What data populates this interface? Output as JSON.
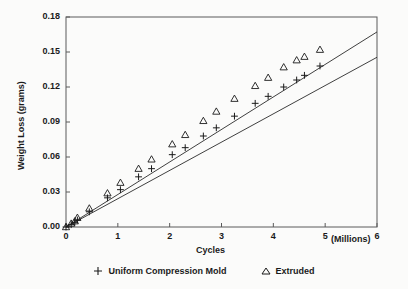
{
  "chart_data": {
    "type": "scatter",
    "title": "",
    "xlabel": "Cycles",
    "xunit": "(Millions)",
    "ylabel": "Weight Loss (grams)",
    "xlim": [
      0,
      6
    ],
    "ylim": [
      0,
      0.18
    ],
    "xticks": [
      "0",
      "1",
      "2",
      "3",
      "4",
      "5",
      "6"
    ],
    "xtick_values": [
      0,
      1,
      2,
      3,
      4,
      5,
      6
    ],
    "yticks": [
      "0.00",
      "0.03",
      "0.06",
      "0.09",
      "0.12",
      "0.15",
      "0.18"
    ],
    "ytick_values": [
      0,
      0.03,
      0.06,
      0.09,
      0.12,
      0.15,
      0.18
    ],
    "grid": false,
    "frame": "box",
    "legend_position": "below",
    "series": [
      {
        "name": "Uniform Compression Mold",
        "marker": "plus",
        "color": "#1a1a1a",
        "points": [
          [
            0.0,
            0.0
          ],
          [
            0.1,
            0.002
          ],
          [
            0.17,
            0.004
          ],
          [
            0.22,
            0.006
          ],
          [
            0.45,
            0.013
          ],
          [
            0.8,
            0.025
          ],
          [
            1.05,
            0.032
          ],
          [
            1.4,
            0.043
          ],
          [
            1.65,
            0.05
          ],
          [
            2.05,
            0.062
          ],
          [
            2.3,
            0.068
          ],
          [
            2.65,
            0.078
          ],
          [
            2.9,
            0.085
          ],
          [
            3.25,
            0.095
          ],
          [
            3.65,
            0.106
          ],
          [
            3.9,
            0.112
          ],
          [
            4.2,
            0.12
          ],
          [
            4.45,
            0.126
          ],
          [
            4.6,
            0.13
          ],
          [
            4.9,
            0.138
          ]
        ],
        "fit_line": {
          "x": [
            0,
            6
          ],
          "y": [
            0.0,
            0.1455
          ]
        }
      },
      {
        "name": "Extruded",
        "marker": "triangle",
        "color": "#1a1a1a",
        "points": [
          [
            0.0,
            0.0
          ],
          [
            0.1,
            0.003
          ],
          [
            0.17,
            0.005
          ],
          [
            0.22,
            0.008
          ],
          [
            0.45,
            0.016
          ],
          [
            0.8,
            0.029
          ],
          [
            1.05,
            0.038
          ],
          [
            1.4,
            0.05
          ],
          [
            1.65,
            0.058
          ],
          [
            2.05,
            0.071
          ],
          [
            2.3,
            0.079
          ],
          [
            2.65,
            0.091
          ],
          [
            2.9,
            0.099
          ],
          [
            3.25,
            0.11
          ],
          [
            3.65,
            0.121
          ],
          [
            3.9,
            0.128
          ],
          [
            4.2,
            0.137
          ],
          [
            4.45,
            0.143
          ],
          [
            4.6,
            0.146
          ],
          [
            4.9,
            0.152
          ]
        ],
        "fit_line": {
          "x": [
            0,
            6
          ],
          "y": [
            0.0,
            0.1672
          ]
        }
      }
    ]
  },
  "axis": {
    "y_title": "Weight Loss (grams)",
    "x_title": "Cycles",
    "x_unit": "(Millions)"
  },
  "legend": {
    "items": [
      {
        "label": "Uniform Compression Mold",
        "marker": "plus-marker"
      },
      {
        "label": "Extruded",
        "marker": "triangle-marker"
      }
    ]
  }
}
